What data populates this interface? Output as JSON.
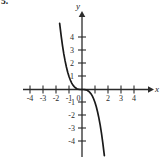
{
  "figure": {
    "label": "5.",
    "width": 165,
    "height": 164
  },
  "chart_data": {
    "type": "line",
    "title": "",
    "subtitle": "",
    "xlabel": "x",
    "ylabel": "y",
    "function": "y = -x^3",
    "grid": false,
    "legend_position": "none",
    "xlim": [
      -4.6,
      5.0
    ],
    "ylim": [
      -4.7,
      4.7
    ],
    "x_tick_labels": [
      "-4",
      "-3",
      "-2",
      "-1",
      "0",
      "2",
      "3",
      "4"
    ],
    "x_tick_values": [
      -4,
      -3,
      -2,
      -1,
      0,
      2,
      3,
      4
    ],
    "y_tick_labels": [
      "4",
      "3",
      "2",
      "1",
      "-1",
      "-2",
      "-3",
      "-4"
    ],
    "y_tick_values": [
      4,
      3,
      2,
      1,
      -1,
      -2,
      -3,
      -4
    ],
    "x_minor_ticks": [
      -4,
      -3,
      -2,
      -1,
      1,
      2,
      3,
      4
    ],
    "y_minor_ticks": [
      4,
      3,
      2,
      1,
      -1,
      -2,
      -3,
      -4
    ],
    "origin_label": "0",
    "axis_arrows": [
      "x-positive",
      "y-positive"
    ],
    "series": [
      {
        "name": "y = -x^3",
        "color": "#1a1a1a",
        "x": [
          -1.72,
          -1.6,
          -1.5,
          -1.4,
          -1.3,
          -1.2,
          -1.1,
          -1.0,
          -0.9,
          -0.8,
          -0.7,
          -0.6,
          -0.5,
          -0.4,
          -0.3,
          -0.2,
          -0.1,
          0.0,
          0.1,
          0.2,
          0.3,
          0.4,
          0.5,
          0.6,
          0.7,
          0.8,
          0.9,
          1.0,
          1.1,
          1.2,
          1.3,
          1.4,
          1.5,
          1.6,
          1.72
        ],
        "y": [
          5.09,
          4.1,
          3.38,
          2.74,
          2.2,
          1.73,
          1.33,
          1.0,
          0.73,
          0.51,
          0.34,
          0.22,
          0.13,
          0.06,
          0.03,
          0.01,
          0.0,
          0.0,
          0.0,
          -0.01,
          -0.03,
          -0.06,
          -0.13,
          -0.22,
          -0.34,
          -0.51,
          -0.73,
          -1.0,
          -1.33,
          -1.73,
          -2.2,
          -2.74,
          -3.38,
          -4.1,
          -5.09
        ]
      }
    ]
  }
}
